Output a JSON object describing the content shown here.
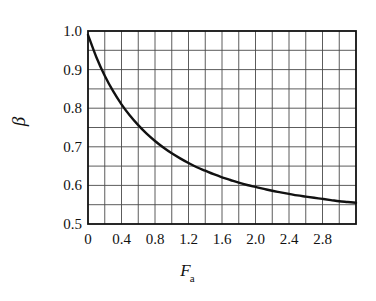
{
  "chart_data": {
    "type": "line",
    "title": "",
    "xlabel": "F_a",
    "xlabel_symbol": "F",
    "xlabel_subscript": "a",
    "ylabel": "β",
    "xlim": [
      0,
      3.2
    ],
    "ylim": [
      0.5,
      1.0
    ],
    "grid": true,
    "grid_x_step": 0.2,
    "grid_y_step": 0.05,
    "legend": "none",
    "xticks": [
      0,
      0.4,
      0.8,
      1.2,
      1.6,
      2.0,
      2.4,
      2.8
    ],
    "xtick_labels": [
      "0",
      "0.4",
      "0.8",
      "1.2",
      "1.6",
      "2.0",
      "2.4",
      "2.8"
    ],
    "yticks": [
      0.5,
      0.6,
      0.7,
      0.8,
      0.9,
      1.0
    ],
    "ytick_labels": [
      "0.5",
      "0.6",
      "0.7",
      "0.8",
      "0.9",
      "1.0"
    ],
    "series": [
      {
        "name": "beta",
        "color": "#111111",
        "line_width": 2.4,
        "x": [
          0,
          0.1,
          0.2,
          0.3,
          0.4,
          0.5,
          0.6,
          0.7,
          0.8,
          0.9,
          1.0,
          1.1,
          1.2,
          1.3,
          1.4,
          1.5,
          1.6,
          1.7,
          1.8,
          1.9,
          2.0,
          2.1,
          2.2,
          2.3,
          2.4,
          2.5,
          2.6,
          2.7,
          2.8,
          2.9,
          3.0,
          3.1,
          3.2
        ],
        "values": [
          0.99,
          0.932,
          0.884,
          0.844,
          0.81,
          0.781,
          0.756,
          0.734,
          0.715,
          0.698,
          0.683,
          0.67,
          0.658,
          0.647,
          0.638,
          0.629,
          0.621,
          0.614,
          0.607,
          0.601,
          0.596,
          0.591,
          0.586,
          0.582,
          0.578,
          0.574,
          0.571,
          0.568,
          0.565,
          0.562,
          0.559,
          0.557,
          0.555
        ]
      }
    ]
  },
  "axes": {
    "frame_color": "#111111",
    "grid_color": "#4a4a4a",
    "background": "#ffffff"
  }
}
